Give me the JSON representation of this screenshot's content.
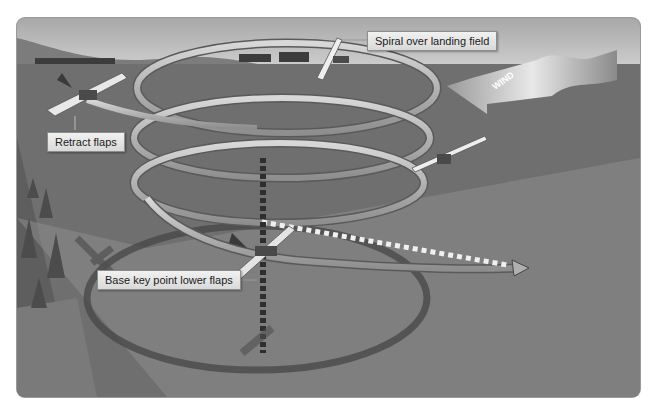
{
  "diagram": {
    "labels": {
      "spiral": "Spiral over landing field",
      "retract": "Retract flaps",
      "base_key": "Base key point lower flaps",
      "wind": "WIND"
    },
    "colors": {
      "sky_top": "#a9a9a9",
      "sky_bottom": "#d4d4d4",
      "ground": "#6e6e6e",
      "ground_light": "#8c8c8c",
      "spiral_band": "#b8b8b8",
      "label_bg": "#e6e6e6"
    }
  }
}
